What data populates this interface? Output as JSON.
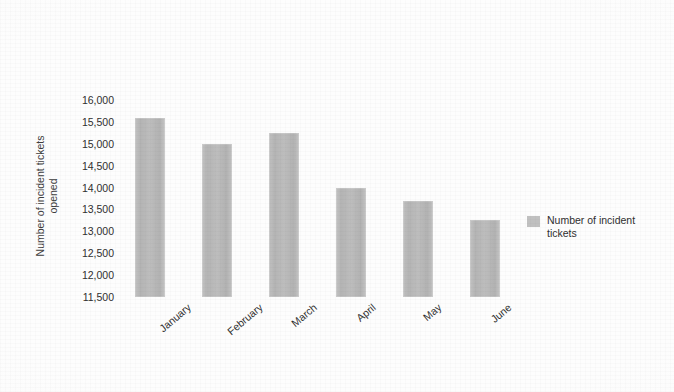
{
  "chart_data": {
    "type": "bar",
    "title": "",
    "xlabel": "",
    "ylabel": "Number of incident tickets opened",
    "ylabel_lines": [
      "Number of incident tickets",
      "opened"
    ],
    "categories": [
      "January",
      "February",
      "March",
      "April",
      "May",
      "June"
    ],
    "values": [
      15600,
      15000,
      15250,
      14000,
      13700,
      13250
    ],
    "series": [
      {
        "name": "Number of incident tickets",
        "values": [
          15600,
          15000,
          15250,
          14000,
          13700,
          13250
        ]
      }
    ],
    "ylim": [
      11500,
      16000
    ],
    "ytick_labels": [
      "16,000",
      "15,500",
      "15,000",
      "14,500",
      "14,000",
      "13,500",
      "13,000",
      "12,500",
      "12,000",
      "11,500"
    ],
    "ytick_values": [
      16000,
      15500,
      15000,
      14500,
      14000,
      13500,
      13000,
      12500,
      12000,
      11500
    ],
    "grid": false,
    "legend_position": "right",
    "legend": [
      {
        "label_lines": [
          "Number of incident",
          "tickets"
        ],
        "label": "Number of incident tickets",
        "color": "#c0c0c0"
      }
    ],
    "colors": {
      "bar": "#bdbdbd",
      "background": "#fdfdfd",
      "text": "#2f2f2f"
    }
  }
}
